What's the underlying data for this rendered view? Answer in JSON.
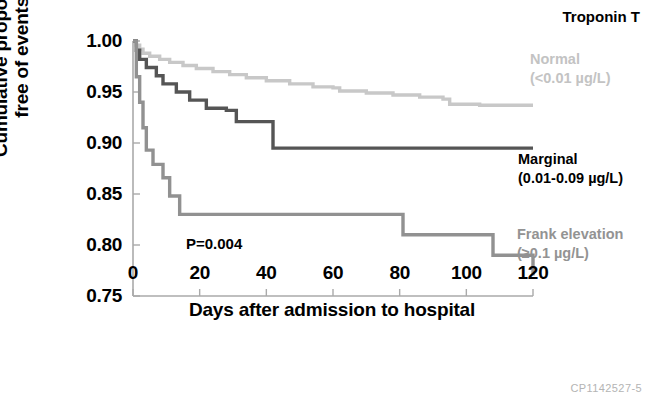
{
  "chart_data": {
    "type": "line",
    "subtype": "kaplan-meier-step",
    "title": "Troponin T",
    "xlabel": "Days after admission to hospital",
    "ylabel": "Cumulative proportion\nfree of events",
    "ylabel_line1": "Cumulative proportion",
    "ylabel_line2": "free of events",
    "xlim": [
      0,
      120
    ],
    "ylim": [
      0.75,
      1.0
    ],
    "xticks": [
      0,
      20,
      40,
      60,
      80,
      100,
      120
    ],
    "xtick_labels": [
      "0",
      "20",
      "40",
      "60",
      "80",
      "100",
      "120"
    ],
    "yticks": [
      0.75,
      0.8,
      0.85,
      0.9,
      0.95,
      1.0
    ],
    "ytick_labels": [
      "0.75",
      "0.80",
      "0.85",
      "0.90",
      "0.95",
      "1.00"
    ],
    "grid": false,
    "legend_position": "inline-right",
    "annotations": [
      {
        "text": "P=0.004",
        "x": 16,
        "y": 0.787
      },
      {
        "text": "CP1142527-5",
        "x": 118,
        "y": 0.74
      }
    ],
    "series": [
      {
        "name": "Normal",
        "label_line1": "Normal",
        "label_line2": "(<0.01 µg/L)",
        "units": "µg/L",
        "threshold": "<0.01",
        "color": "#c8c8c8",
        "x": [
          0,
          1,
          2,
          3,
          5,
          8,
          11,
          15,
          19,
          24,
          29,
          34,
          40,
          47,
          54,
          60,
          62,
          70,
          78,
          86,
          93,
          95,
          104,
          112,
          120
        ],
        "y": [
          1.0,
          0.996,
          0.992,
          0.988,
          0.985,
          0.982,
          0.979,
          0.976,
          0.973,
          0.97,
          0.967,
          0.964,
          0.961,
          0.958,
          0.955,
          0.954,
          0.951,
          0.949,
          0.947,
          0.945,
          0.943,
          0.938,
          0.937,
          0.937,
          0.937
        ]
      },
      {
        "name": "Marginal",
        "label_line1": "Marginal",
        "label_line2": "(0.01-0.09 µg/L)",
        "units": "µg/L",
        "threshold": "0.01-0.09",
        "color": "#555555",
        "x": [
          0,
          1,
          2,
          4,
          7,
          9,
          13,
          17,
          22,
          28,
          31,
          42,
          120
        ],
        "y": [
          1.0,
          0.991,
          0.982,
          0.974,
          0.966,
          0.958,
          0.95,
          0.942,
          0.934,
          0.932,
          0.921,
          0.895,
          0.895
        ]
      },
      {
        "name": "Frank elevation",
        "label_line1": "Frank elevation",
        "label_line2": "(≥0.1 µg/L)",
        "units": "µg/L",
        "threshold": "≥0.1",
        "color": "#919191",
        "x": [
          0,
          1,
          2,
          3,
          4,
          6,
          9,
          11,
          14,
          68,
          81,
          108,
          120
        ],
        "y": [
          1.0,
          0.965,
          0.94,
          0.915,
          0.893,
          0.879,
          0.866,
          0.848,
          0.83,
          0.83,
          0.81,
          0.79,
          0.77
        ]
      }
    ]
  },
  "figure": {
    "id_watermark": "CP1142527-5"
  }
}
